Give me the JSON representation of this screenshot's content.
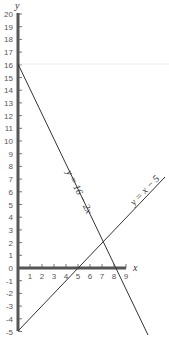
{
  "chart_data": {
    "type": "line",
    "title": "",
    "xlabel": "x",
    "ylabel": "y",
    "xlim": [
      0,
      9
    ],
    "ylim": [
      -5,
      20
    ],
    "x_ticks": [
      "1",
      "2",
      "3",
      "4",
      "5",
      "6",
      "7",
      "8",
      "9"
    ],
    "y_ticks": [
      "20",
      "19",
      "18",
      "17",
      "16",
      "15",
      "14",
      "13",
      "12",
      "11",
      "10",
      "9",
      "8",
      "7",
      "6",
      "5",
      "4",
      "3",
      "2",
      "1",
      "0",
      "-1",
      "-2",
      "-3",
      "-4",
      "-5"
    ],
    "grid": false,
    "series": [
      {
        "name": "y = 16 - 2x",
        "label": "y = 16 − 2x",
        "x": [
          0,
          10.8
        ],
        "y": [
          16,
          -5.6
        ]
      },
      {
        "name": "y = x - 5",
        "label": "y = x − 5",
        "x": [
          0,
          12.2
        ],
        "y": [
          -5,
          7.2
        ]
      }
    ],
    "annotations": [
      "y = 16 − 2x",
      "y = x − 5"
    ],
    "intersection": {
      "x": 7,
      "y": 2
    }
  },
  "labels": {
    "x_axis": "x",
    "y_axis": "y",
    "line1": "y = 16 − 2x",
    "line2": "y = x − 5"
  }
}
